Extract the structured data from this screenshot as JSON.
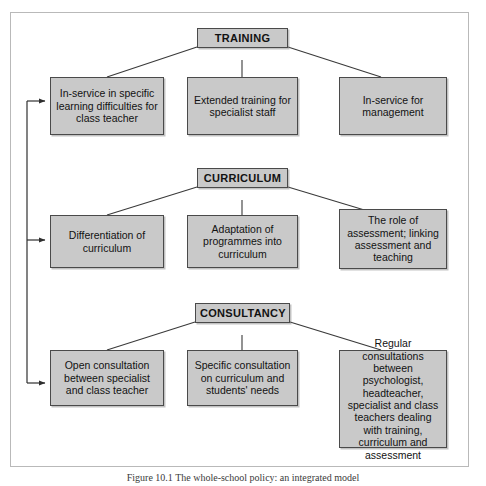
{
  "figure": {
    "caption": "Figure 10.1  The whole-school policy: an integrated model",
    "colors": {
      "box_fill": "#c9c9c9",
      "box_border": "#4a4a4a",
      "line": "#3a3a3a",
      "frame_border": "#b9b9b9",
      "page_background": "#ffffff"
    },
    "sections": [
      {
        "id": "training",
        "header": "TRAINING",
        "children": [
          "In-service in specific learning difficulties for class teacher",
          "Extended training for specialist staff",
          "In-service for management"
        ]
      },
      {
        "id": "curriculum",
        "header": "CURRICULUM",
        "children": [
          "Differentiation of curriculum",
          "Adaptation of programmes into curriculum",
          "The role of assessment; linking assessment and teaching"
        ]
      },
      {
        "id": "consultancy",
        "header": "CONSULTANCY",
        "children": [
          "Open consultation between specialist and class teacher",
          "Specific consultation on curriculum and students' needs",
          "Regular consultations between psychologist, headteacher, specialist and class teachers dealing with training, curriculum and assessment"
        ]
      }
    ],
    "feedback_spine": {
      "description": "Vertical feedback line on the left linking the three left-hand boxes",
      "arrow_targets": [
        "In-service in specific learning difficulties for class teacher",
        "Differentiation of curriculum",
        "Open consultation between specialist and class teacher"
      ]
    }
  }
}
